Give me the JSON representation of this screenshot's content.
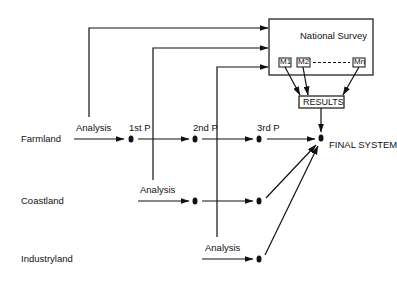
{
  "diagram": {
    "survey_box": {
      "title": "National Survey",
      "modules": [
        "M1",
        "M2",
        "Mn"
      ],
      "ellipsis": "---------"
    },
    "results": "RESULTS",
    "final": "FINAL SYSTEM",
    "regions": [
      {
        "name": "Farmland",
        "analysis": "Analysis",
        "phases": [
          "1st P",
          "2nd P",
          "3rd P"
        ]
      },
      {
        "name": "Coastland",
        "analysis": "Analysis"
      },
      {
        "name": "Industryland",
        "analysis": "Analysis"
      }
    ],
    "colors": {
      "line": "#111111",
      "background": "#ffffff"
    }
  }
}
